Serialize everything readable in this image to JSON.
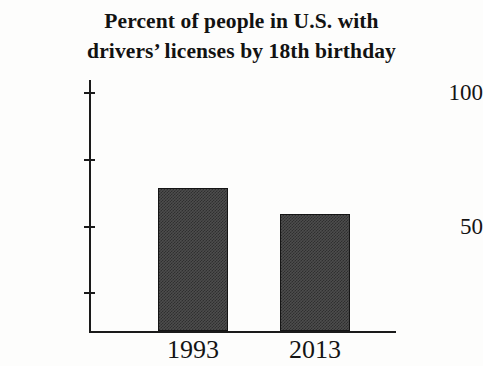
{
  "chart_data": {
    "type": "bar",
    "title_lines": [
      "Percent of people in U.S. with",
      "drivers’ licenses by 18th birthday"
    ],
    "categories": [
      "1993",
      "2013"
    ],
    "values": [
      60,
      49
    ],
    "xlabel": "",
    "ylabel": "",
    "ylim": [
      0,
      100
    ],
    "yticks": [
      25,
      50,
      75,
      100
    ],
    "ytick_labels": [
      "",
      "50",
      "",
      "100"
    ],
    "labeled_yticks": [
      "50",
      "100"
    ],
    "grid": false,
    "legend": false,
    "legend_position": "none",
    "bar_fill_color": "#4d4d4d",
    "bar_edge_color": "#151515",
    "axis_color": "#1a1a1a",
    "background_color": "#fdfdfc",
    "text_color": "#141414"
  },
  "axis": {
    "y_tick_100": "100",
    "y_tick_75": "",
    "y_tick_50": "50",
    "y_tick_25": ""
  },
  "bars": [
    {
      "label": "1993",
      "value": 60
    },
    {
      "label": "2013",
      "value": 49
    }
  ]
}
